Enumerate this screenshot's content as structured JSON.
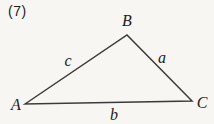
{
  "figure": {
    "problem_number": "(7)",
    "type": "triangle-diagram",
    "vertices": [
      {
        "label": "A",
        "position": "bottom-left"
      },
      {
        "label": "B",
        "position": "top"
      },
      {
        "label": "C",
        "position": "bottom-right"
      }
    ],
    "sides": [
      {
        "label": "a",
        "between": "B-C"
      },
      {
        "label": "b",
        "between": "A-C"
      },
      {
        "label": "c",
        "between": "A-B"
      }
    ],
    "colors": {
      "background": "#f7f6f2",
      "line": "#3a3a3a",
      "text": "#1c1c1c"
    }
  }
}
